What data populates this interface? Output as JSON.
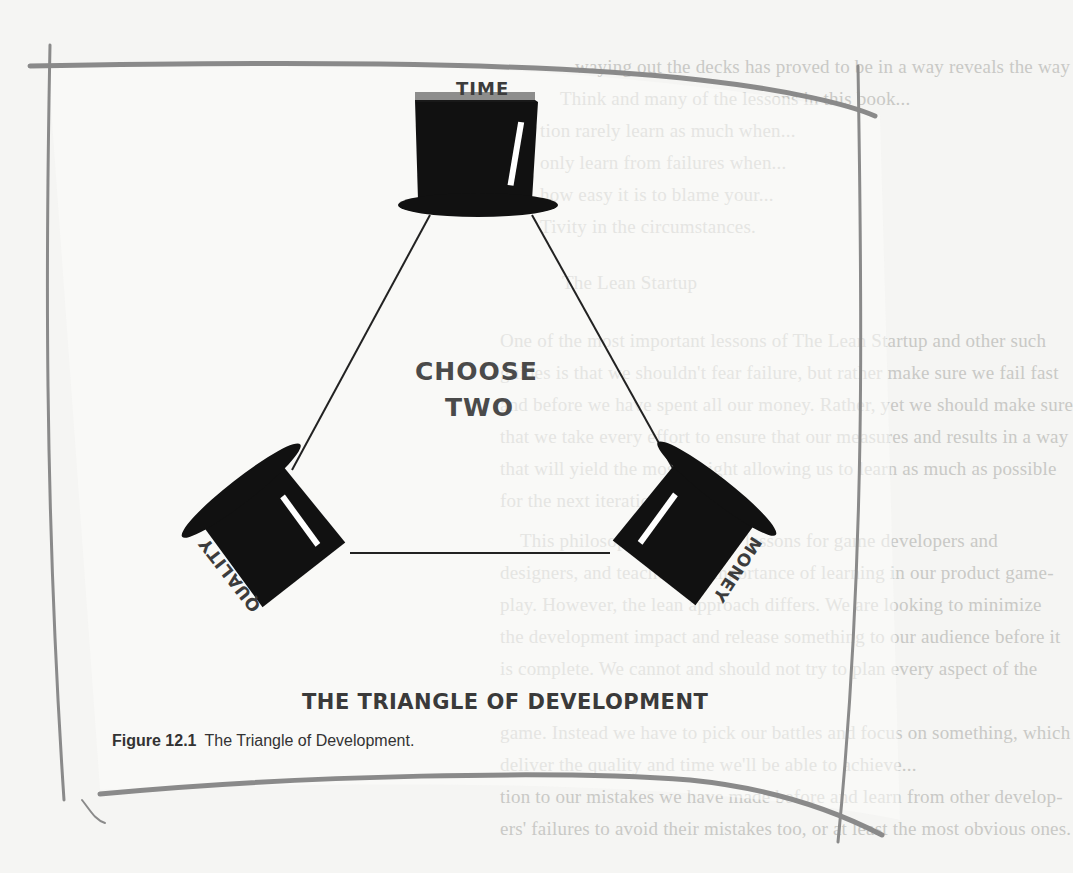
{
  "figure": {
    "number_label": "Figure 12.1",
    "caption_text": "The Triangle of Development."
  },
  "diagram": {
    "title": "THE TRIANGLE OF DEVELOPMENT",
    "center_text_line1": "CHOOSE",
    "center_text_line2": "TWO",
    "vertices": [
      {
        "label": "TIME",
        "position": "top",
        "icon": "top-hat-icon"
      },
      {
        "label": "QUALITY",
        "position": "bottom-left",
        "icon": "top-hat-icon"
      },
      {
        "label": "MONEY",
        "position": "bottom-right",
        "icon": "top-hat-icon"
      }
    ],
    "colors": {
      "hat": "#111111",
      "line": "#222222",
      "frame_stroke": "#8a8a8a",
      "background": "#f5f5f3",
      "bleed_text": "#c9c9c6"
    }
  },
  "bleed_through_text": [
    "waying out the decks has proved to be in a way reveals the way",
    "Think and many of the lessons in this book...",
    "tion rarely learn as much when...",
    "only learn from failures when...",
    "how easy it is to blame your...",
    "Tivity in the circumstances.",
    "The Lean Startup",
    "One of the most important lessons of The Lean Startup and other such",
    "guides is that we shouldn't fear failure, but rather make sure we fail fast",
    "and before we have spent all our money. Rather, yet we should make sure",
    "that we take every effort to ensure that our measures and results in a way",
    "that will yield the most insight allowing us to learn as much as possible",
    "for the next iteration.",
    "This philosophy at heart has lessons for game developers and",
    "designers, and teaches the importance of learning in our product game-",
    "play. However, the lean approach differs. We are looking to minimize",
    "the development impact and release something to our audience before it",
    "is complete. We cannot and should not try to plan every aspect of the",
    "game. Instead we have to pick our battles and focus on something, which",
    "deliver the quality and time we'll be able to achieve...",
    "tion to our mistakes we have made before and learn from other develop-",
    "ers' failures to avoid their mistakes too, or at least the most obvious ones."
  ]
}
